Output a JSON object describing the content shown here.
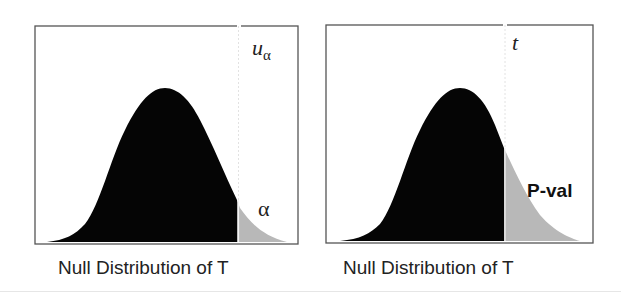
{
  "panels": [
    {
      "id": "critical-value",
      "top_label": "u",
      "top_label_subscript": "α",
      "area_label": "α",
      "caption": "Null Distribution of T"
    },
    {
      "id": "p-value",
      "top_label": "t",
      "area_label": "P-val",
      "caption": "Null Distribution of T"
    }
  ],
  "colors": {
    "body_fill": "#050505",
    "tail_fill": "#b8b8b8",
    "frame": "#555555",
    "cutoff_line": "#dddddd"
  }
}
